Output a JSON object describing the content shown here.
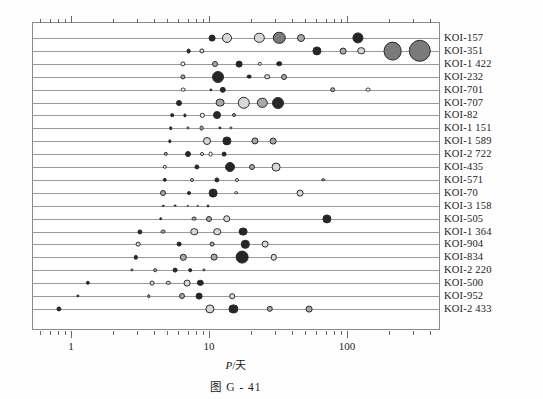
{
  "caption": "图 G - 41",
  "axis": {
    "xlabel_symbol": "P",
    "xlabel_sep": "/",
    "xlabel_unit": "天",
    "ticks": [
      {
        "value": 1,
        "label": "1"
      },
      {
        "value": 10,
        "label": "10"
      },
      {
        "value": 100,
        "label": "100"
      },
      {
        "value": 1000,
        "label": "1 000"
      }
    ]
  },
  "colors": {
    "frame": "#8a8a8a",
    "row_line": "#9a9a9a",
    "dot_outline": "#2a2a2a",
    "fill_white": "#ffffff",
    "fill_light": "#d8d8d8",
    "fill_mid": "#a8a8a8",
    "fill_dark": "#7a7a7a",
    "fill_black": "#262626",
    "text": "#1a1a1a"
  },
  "chart_data": {
    "type": "scatter",
    "title": "",
    "subtitle": "",
    "xlabel": "P/天",
    "ylabel": "",
    "xscale": "log",
    "xlim": [
      0.6,
      1400
    ],
    "grid": false,
    "legend": null,
    "annotations": [],
    "size_encodes": "planet radius",
    "series": [
      {
        "name": "KOI-157",
        "points": [
          {
            "x": 10.3,
            "r": 3.4,
            "fill": "#262626"
          },
          {
            "x": 13.2,
            "r": 5.0,
            "fill": "#d8d8d8"
          },
          {
            "x": 22.7,
            "r": 5.2,
            "fill": "#d8d8d8"
          },
          {
            "x": 31.8,
            "r": 6.2,
            "fill": "#7a7a7a"
          },
          {
            "x": 46.0,
            "r": 4.0,
            "fill": "#a8a8a8"
          },
          {
            "x": 118.0,
            "r": 5.6,
            "fill": "#262626"
          }
        ]
      },
      {
        "name": "KOI-351",
        "points": [
          {
            "x": 7.0,
            "r": 2.4,
            "fill": "#262626"
          },
          {
            "x": 8.7,
            "r": 2.6,
            "fill": "#d8d8d8"
          },
          {
            "x": 59.7,
            "r": 4.6,
            "fill": "#262626"
          },
          {
            "x": 91.9,
            "r": 3.4,
            "fill": "#a8a8a8"
          },
          {
            "x": 125.0,
            "r": 3.8,
            "fill": "#d8d8d8"
          },
          {
            "x": 210.6,
            "r": 9.4,
            "fill": "#7a7a7a"
          },
          {
            "x": 331.6,
            "r": 11.2,
            "fill": "#7a7a7a"
          }
        ]
      },
      {
        "name": "KOI-1 422",
        "points": [
          {
            "x": 6.4,
            "r": 2.6,
            "fill": "#ffffff"
          },
          {
            "x": 10.9,
            "r": 3.0,
            "fill": "#a8a8a8"
          },
          {
            "x": 16.2,
            "r": 3.4,
            "fill": "#262626"
          },
          {
            "x": 23.0,
            "r": 2.2,
            "fill": "#ffffff"
          },
          {
            "x": 31.8,
            "r": 2.8,
            "fill": "#262626"
          }
        ]
      },
      {
        "name": "KOI-232",
        "points": [
          {
            "x": 6.4,
            "r": 2.6,
            "fill": "#a8a8a8"
          },
          {
            "x": 11.5,
            "r": 6.0,
            "fill": "#262626"
          },
          {
            "x": 19.1,
            "r": 2.4,
            "fill": "#262626"
          },
          {
            "x": 26.0,
            "r": 2.8,
            "fill": "#d8d8d8"
          },
          {
            "x": 34.5,
            "r": 3.0,
            "fill": "#a8a8a8"
          }
        ]
      },
      {
        "name": "KOI-701",
        "points": [
          {
            "x": 6.4,
            "r": 2.4,
            "fill": "#ffffff"
          },
          {
            "x": 10.2,
            "r": 1.6,
            "fill": "#262626"
          },
          {
            "x": 12.4,
            "r": 3.2,
            "fill": "#262626"
          },
          {
            "x": 77.6,
            "r": 2.8,
            "fill": "#a8a8a8"
          },
          {
            "x": 140.0,
            "r": 2.4,
            "fill": "#ffffff"
          }
        ]
      },
      {
        "name": "KOI-707",
        "points": [
          {
            "x": 6.0,
            "r": 3.0,
            "fill": "#262626"
          },
          {
            "x": 11.9,
            "r": 4.4,
            "fill": "#a8a8a8"
          },
          {
            "x": 17.6,
            "r": 6.2,
            "fill": "#d8d8d8"
          },
          {
            "x": 24.0,
            "r": 5.2,
            "fill": "#a8a8a8"
          },
          {
            "x": 31.0,
            "r": 6.0,
            "fill": "#262626"
          }
        ]
      },
      {
        "name": "KOI-82",
        "points": [
          {
            "x": 5.3,
            "r": 1.8,
            "fill": "#262626"
          },
          {
            "x": 6.6,
            "r": 1.6,
            "fill": "#262626"
          },
          {
            "x": 8.8,
            "r": 2.2,
            "fill": "#ffffff"
          },
          {
            "x": 11.2,
            "r": 4.0,
            "fill": "#262626"
          },
          {
            "x": 15.0,
            "r": 2.0,
            "fill": "#a8a8a8"
          }
        ]
      },
      {
        "name": "KOI-1 151",
        "points": [
          {
            "x": 5.2,
            "r": 1.8,
            "fill": "#262626"
          },
          {
            "x": 6.9,
            "r": 1.6,
            "fill": "#d8d8d8"
          },
          {
            "x": 8.7,
            "r": 2.4,
            "fill": "#a8a8a8"
          },
          {
            "x": 11.8,
            "r": 1.6,
            "fill": "#262626"
          },
          {
            "x": 14.2,
            "r": 1.6,
            "fill": "#d8d8d8"
          }
        ]
      },
      {
        "name": "KOI-1 589",
        "points": [
          {
            "x": 5.1,
            "r": 1.7,
            "fill": "#262626"
          },
          {
            "x": 9.5,
            "r": 4.0,
            "fill": "#d8d8d8"
          },
          {
            "x": 13.2,
            "r": 4.6,
            "fill": "#262626"
          },
          {
            "x": 21.1,
            "r": 3.6,
            "fill": "#a8a8a8"
          },
          {
            "x": 28.6,
            "r": 3.4,
            "fill": "#a8a8a8"
          }
        ]
      },
      {
        "name": "KOI-2 722",
        "points": [
          {
            "x": 4.8,
            "r": 2.2,
            "fill": "#a8a8a8"
          },
          {
            "x": 6.9,
            "r": 3.0,
            "fill": "#262626"
          },
          {
            "x": 8.7,
            "r": 2.0,
            "fill": "#ffffff"
          },
          {
            "x": 10.1,
            "r": 2.4,
            "fill": "#ffffff"
          },
          {
            "x": 12.6,
            "r": 2.4,
            "fill": "#262626"
          }
        ]
      },
      {
        "name": "KOI-435",
        "points": [
          {
            "x": 4.7,
            "r": 2.2,
            "fill": "#ffffff"
          },
          {
            "x": 8.0,
            "r": 2.6,
            "fill": "#262626"
          },
          {
            "x": 14.0,
            "r": 5.0,
            "fill": "#262626"
          },
          {
            "x": 20.0,
            "r": 3.0,
            "fill": "#a8a8a8"
          },
          {
            "x": 30.3,
            "r": 4.4,
            "fill": "#d8d8d8"
          }
        ]
      },
      {
        "name": "KOI-571",
        "points": [
          {
            "x": 4.7,
            "r": 2.2,
            "fill": "#262626"
          },
          {
            "x": 7.4,
            "r": 2.0,
            "fill": "#d8d8d8"
          },
          {
            "x": 11.2,
            "r": 2.6,
            "fill": "#262626"
          },
          {
            "x": 15.6,
            "r": 2.0,
            "fill": "#ffffff"
          },
          {
            "x": 66.0,
            "r": 1.8,
            "fill": "#a8a8a8"
          }
        ]
      },
      {
        "name": "KOI-70",
        "points": [
          {
            "x": 4.6,
            "r": 3.0,
            "fill": "#a8a8a8"
          },
          {
            "x": 7.1,
            "r": 2.0,
            "fill": "#262626"
          },
          {
            "x": 10.6,
            "r": 4.4,
            "fill": "#262626"
          },
          {
            "x": 15.5,
            "r": 1.8,
            "fill": "#ffffff"
          },
          {
            "x": 45.0,
            "r": 3.4,
            "fill": "#d8d8d8"
          }
        ]
      },
      {
        "name": "KOI-3 158",
        "points": [
          {
            "x": 4.6,
            "r": 1.2,
            "fill": "#262626"
          },
          {
            "x": 5.6,
            "r": 1.4,
            "fill": "#262626"
          },
          {
            "x": 6.9,
            "r": 1.2,
            "fill": "#262626"
          },
          {
            "x": 8.2,
            "r": 1.2,
            "fill": "#262626"
          },
          {
            "x": 9.7,
            "r": 1.5,
            "fill": "#262626"
          }
        ]
      },
      {
        "name": "KOI-505",
        "points": [
          {
            "x": 4.4,
            "r": 1.8,
            "fill": "#262626"
          },
          {
            "x": 7.7,
            "r": 2.4,
            "fill": "#a8a8a8"
          },
          {
            "x": 9.8,
            "r": 3.0,
            "fill": "#a8a8a8"
          },
          {
            "x": 13.2,
            "r": 3.8,
            "fill": "#d8d8d8"
          },
          {
            "x": 70.0,
            "r": 4.6,
            "fill": "#262626"
          }
        ]
      },
      {
        "name": "KOI-1 364",
        "points": [
          {
            "x": 3.1,
            "r": 2.6,
            "fill": "#262626"
          },
          {
            "x": 4.6,
            "r": 2.4,
            "fill": "#a8a8a8"
          },
          {
            "x": 7.7,
            "r": 3.8,
            "fill": "#d8d8d8"
          },
          {
            "x": 11.3,
            "r": 3.8,
            "fill": "#d8d8d8"
          },
          {
            "x": 17.4,
            "r": 4.4,
            "fill": "#262626"
          }
        ]
      },
      {
        "name": "KOI-904",
        "points": [
          {
            "x": 3.0,
            "r": 2.4,
            "fill": "#d8d8d8"
          },
          {
            "x": 6.0,
            "r": 2.4,
            "fill": "#262626"
          },
          {
            "x": 10.4,
            "r": 2.4,
            "fill": "#a8a8a8"
          },
          {
            "x": 18.0,
            "r": 4.2,
            "fill": "#262626"
          },
          {
            "x": 25.0,
            "r": 3.4,
            "fill": "#d8d8d8"
          }
        ]
      },
      {
        "name": "KOI-834",
        "points": [
          {
            "x": 2.9,
            "r": 2.2,
            "fill": "#262626"
          },
          {
            "x": 6.4,
            "r": 3.2,
            "fill": "#a8a8a8"
          },
          {
            "x": 10.7,
            "r": 3.4,
            "fill": "#a8a8a8"
          },
          {
            "x": 17.0,
            "r": 6.4,
            "fill": "#262626"
          },
          {
            "x": 29.0,
            "r": 3.2,
            "fill": "#d8d8d8"
          }
        ]
      },
      {
        "name": "KOI-2 220",
        "points": [
          {
            "x": 2.7,
            "r": 1.6,
            "fill": "#a8a8a8"
          },
          {
            "x": 4.0,
            "r": 1.8,
            "fill": "#a8a8a8"
          },
          {
            "x": 5.6,
            "r": 2.4,
            "fill": "#262626"
          },
          {
            "x": 7.2,
            "r": 1.8,
            "fill": "#262626"
          },
          {
            "x": 9.0,
            "r": 1.6,
            "fill": "#a8a8a8"
          }
        ]
      },
      {
        "name": "KOI-500",
        "points": [
          {
            "x": 1.3,
            "r": 2.2,
            "fill": "#262626"
          },
          {
            "x": 3.8,
            "r": 2.4,
            "fill": "#d8d8d8"
          },
          {
            "x": 5.0,
            "r": 2.2,
            "fill": "#d8d8d8"
          },
          {
            "x": 6.8,
            "r": 3.4,
            "fill": "#d8d8d8"
          },
          {
            "x": 8.5,
            "r": 3.2,
            "fill": "#262626"
          }
        ]
      },
      {
        "name": "KOI-952",
        "points": [
          {
            "x": 1.1,
            "r": 1.6,
            "fill": "#262626"
          },
          {
            "x": 3.6,
            "r": 1.8,
            "fill": "#a8a8a8"
          },
          {
            "x": 6.3,
            "r": 3.0,
            "fill": "#a8a8a8"
          },
          {
            "x": 8.3,
            "r": 3.4,
            "fill": "#262626"
          },
          {
            "x": 14.5,
            "r": 2.8,
            "fill": "#d8d8d8"
          }
        ]
      },
      {
        "name": "KOI-2 433",
        "points": [
          {
            "x": 0.8,
            "r": 2.6,
            "fill": "#262626"
          },
          {
            "x": 10.0,
            "r": 4.6,
            "fill": "#d8d8d8"
          },
          {
            "x": 14.8,
            "r": 4.6,
            "fill": "#262626"
          },
          {
            "x": 27.0,
            "r": 3.2,
            "fill": "#a8a8a8"
          },
          {
            "x": 52.0,
            "r": 3.4,
            "fill": "#a8a8a8"
          }
        ]
      }
    ]
  }
}
